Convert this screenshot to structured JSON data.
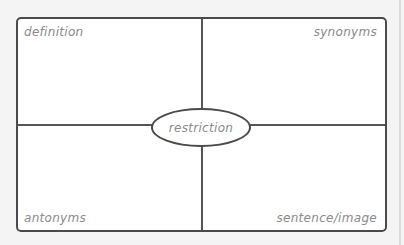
{
  "diagram": {
    "type": "frayer-model",
    "center_word": "restriction",
    "quadrants": {
      "top_left": "definition",
      "top_right": "synonyms",
      "bottom_left": "antonyms",
      "bottom_right": "sentence/image"
    },
    "colors": {
      "border": "#4a4a4a",
      "label_text": "#8a8a8a",
      "background": "#ffffff"
    }
  }
}
